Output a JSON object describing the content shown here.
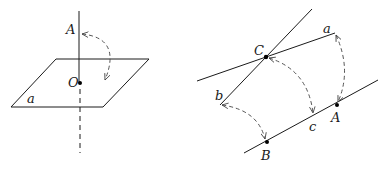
{
  "figures": [
    {
      "id": "left",
      "description": "Line through point A perpendicular to plane a at point O, rotation arrow from A toward plane",
      "labels": {
        "A": "A",
        "O": "O",
        "plane": "a"
      },
      "colors": {
        "stroke": "#1a1a1a",
        "dashed": "#555555"
      }
    },
    {
      "id": "right",
      "description": "Lines a and b intersecting at C, line through B, c, A; dashed rotation arcs a→A, C→c, b→B",
      "labels": {
        "C": "C",
        "a": "a",
        "b": "b",
        "c": "c",
        "A": "A",
        "B": "B"
      },
      "colors": {
        "stroke": "#1a1a1a",
        "dashed": "#555555"
      }
    }
  ]
}
